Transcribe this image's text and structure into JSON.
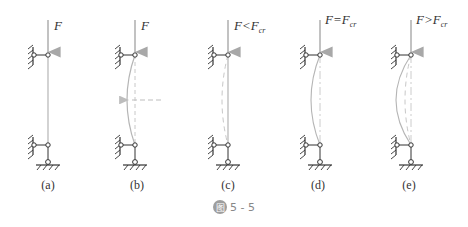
{
  "figure": {
    "caption_icon": "图",
    "caption_number": "5 - 5",
    "panels": [
      {
        "id": "a",
        "caption": "(a)",
        "force_label": "F",
        "force_sub": "",
        "x": 48,
        "state": "straight"
      },
      {
        "id": "b",
        "caption": "(b)",
        "force_label": "F",
        "force_sub": "",
        "x": 135,
        "state": "disturbed"
      },
      {
        "id": "c",
        "caption": "(c)",
        "force_label": "F<F",
        "force_sub": "cr",
        "x": 228,
        "state": "returns-straight"
      },
      {
        "id": "d",
        "caption": "(d)",
        "force_label": "F=F",
        "force_sub": "cr",
        "x": 320,
        "state": "neutral-equilibrium"
      },
      {
        "id": "e",
        "caption": "(e)",
        "force_label": "F>F",
        "force_sub": "cr",
        "x": 411,
        "state": "buckled"
      }
    ]
  },
  "colors": {
    "structure": "#333333",
    "column": "#b5b5b5",
    "dashed": "#bdbdbd",
    "caption_badge": "#9e9e9e"
  }
}
